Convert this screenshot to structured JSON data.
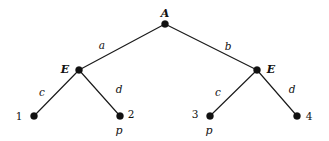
{
  "diagram": {
    "kind": "parse-tree",
    "background_color": "#ffffff",
    "ink_color": "#111111",
    "width": 329,
    "height": 141,
    "nodes": [
      {
        "id": "root",
        "label": "A",
        "x": 165,
        "y": 24,
        "label_x": 165,
        "label_y": 13,
        "label_pos": "above"
      },
      {
        "id": "e-left",
        "label": "E",
        "x": 79,
        "y": 70,
        "label_x": 65,
        "label_y": 69,
        "label_pos": "left"
      },
      {
        "id": "e-right",
        "label": "E",
        "x": 257,
        "y": 70,
        "label_x": 271,
        "label_y": 69,
        "label_pos": "right"
      },
      {
        "id": "leaf-1",
        "label": "1",
        "x": 34,
        "y": 116,
        "label_x": 19,
        "label_y": 116,
        "label_pos": "left"
      },
      {
        "id": "leaf-2",
        "label": "2",
        "x": 120,
        "y": 116,
        "label_x": 131,
        "label_y": 114,
        "label_pos": "right"
      },
      {
        "id": "leaf-3",
        "label": "3",
        "x": 210,
        "y": 116,
        "label_x": 195,
        "label_y": 114,
        "label_pos": "left"
      },
      {
        "id": "leaf-4",
        "label": "4",
        "x": 297,
        "y": 116,
        "label_x": 309,
        "label_y": 116,
        "label_pos": "right"
      }
    ],
    "edges": [
      {
        "id": "edge-a",
        "from": "root",
        "to": "e-left",
        "label": "a",
        "label_x": 102,
        "label_y": 45
      },
      {
        "id": "edge-b",
        "from": "root",
        "to": "e-right",
        "label": "b",
        "label_x": 228,
        "label_y": 46
      },
      {
        "id": "edge-c-left",
        "from": "e-left",
        "to": "leaf-1",
        "label": "c",
        "label_x": 42,
        "label_y": 92
      },
      {
        "id": "edge-d-left",
        "from": "e-left",
        "to": "leaf-2",
        "label": "d",
        "label_x": 119,
        "label_y": 89
      },
      {
        "id": "edge-c-right",
        "from": "e-right",
        "to": "leaf-3",
        "label": "c",
        "label_x": 218,
        "label_y": 92
      },
      {
        "id": "edge-d-right",
        "from": "e-right",
        "to": "leaf-4",
        "label": "d",
        "label_x": 292,
        "label_y": 89
      }
    ],
    "annotations": [
      {
        "id": "prod-leaf-2",
        "label": "p",
        "x": 119,
        "y": 130
      },
      {
        "id": "prod-leaf-3",
        "label": "p",
        "x": 209,
        "y": 130
      }
    ]
  }
}
